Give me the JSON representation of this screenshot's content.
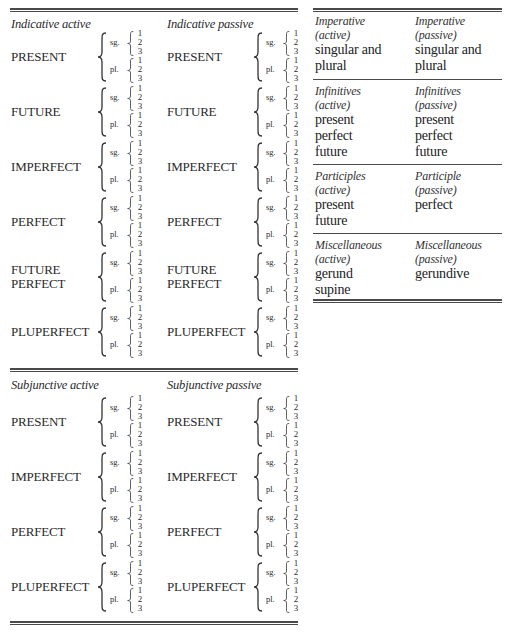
{
  "indicative": {
    "active_heading": "Indicative active",
    "passive_heading": "Indicative passive",
    "tenses": [
      "PRESENT",
      "FUTURE",
      "IMPERFECT",
      "PERFECT",
      "FUTURE PERFECT",
      "PLUPERFECT"
    ]
  },
  "subjunctive": {
    "active_heading": "Subjunctive active",
    "passive_heading": "Subjunctive passive",
    "tenses": [
      "PRESENT",
      "IMPERFECT",
      "PERFECT",
      "PLUPERFECT"
    ]
  },
  "number_labels": {
    "singular": "sg.",
    "plural": "pl."
  },
  "persons": [
    "1",
    "2",
    "3"
  ],
  "right_table": {
    "sections": [
      {
        "active": {
          "heading_1": "Imperative",
          "heading_2": "(active)",
          "items": [
            "singular and",
            "plural"
          ]
        },
        "passive": {
          "heading_1": "Imperative",
          "heading_2": "(passive)",
          "items": [
            "singular and",
            "plural"
          ]
        }
      },
      {
        "active": {
          "heading_1": "Infinitives",
          "heading_2": "(active)",
          "items": [
            "present",
            "perfect",
            "future"
          ]
        },
        "passive": {
          "heading_1": "Infinitives",
          "heading_2": "(passive)",
          "items": [
            "present",
            "perfect",
            "future"
          ]
        }
      },
      {
        "active": {
          "heading_1": "Participles",
          "heading_2": "(active)",
          "items": [
            "present",
            "future"
          ]
        },
        "passive": {
          "heading_1": "Participle",
          "heading_2": "(passive)",
          "items": [
            "perfect"
          ]
        }
      },
      {
        "active": {
          "heading_1": "Miscellaneous",
          "heading_2": "(active)",
          "items": [
            "gerund",
            "supine"
          ]
        },
        "passive": {
          "heading_1": "Miscellaneous",
          "heading_2": "(passive)",
          "items": [
            "gerundive"
          ]
        }
      }
    ]
  }
}
